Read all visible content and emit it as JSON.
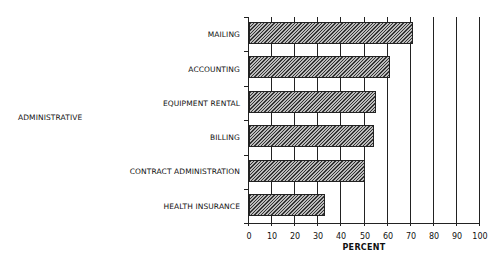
{
  "chart_data": {
    "type": "bar",
    "orientation": "horizontal",
    "title": "",
    "group_label": "ADMINISTRATIVE",
    "categories": [
      "MAILING",
      "ACCOUNTING",
      "EQUIPMENT RENTAL",
      "BILLING",
      "CONTRACT ADMINISTRATION",
      "HEALTH INSURANCE"
    ],
    "values": [
      71,
      61,
      55,
      54,
      50,
      33
    ],
    "xlabel": "PERCENT",
    "ylabel": "",
    "xlim": [
      0,
      100
    ],
    "xticks": [
      "0",
      "10",
      "20",
      "30",
      "40",
      "50",
      "60",
      "70",
      "80",
      "90",
      "100"
    ],
    "grid": "vertical",
    "legend": null,
    "bar_fill": "diagonal hatch"
  }
}
